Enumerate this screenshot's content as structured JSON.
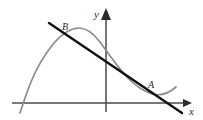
{
  "figure": {
    "background_color": "#ffffff",
    "width": 203,
    "height": 120
  },
  "axes": {
    "x_axis": {
      "label": "x",
      "color": "#4a4a4a",
      "arrow": "right-arrow-icon",
      "start": [
        12,
        103
      ],
      "end": [
        186,
        103
      ],
      "label_position": [
        190,
        112
      ]
    },
    "y_axis": {
      "label": "y",
      "color": "#4a4a4a",
      "arrow": "up-arrow-icon",
      "start": [
        106,
        112
      ],
      "end": [
        106,
        12
      ],
      "label_position": [
        96,
        16
      ]
    },
    "origin": [
      106,
      103
    ]
  },
  "curve": {
    "name": "cubic-curve",
    "color": "#8c8c8c",
    "stroke_width": 1.6,
    "description": "Rises from lower-left, peaks left of the y-axis, descends through the y-axis, reaches a local minimum at the right, then rises slightly",
    "path_points": [
      [
        20,
        112
      ],
      [
        24,
        101
      ],
      [
        30,
        84
      ],
      [
        38,
        66
      ],
      [
        48,
        50
      ],
      [
        58,
        38
      ],
      [
        68,
        31
      ],
      [
        78,
        28
      ],
      [
        86,
        29
      ],
      [
        94,
        34
      ],
      [
        102,
        43
      ],
      [
        110,
        54
      ],
      [
        120,
        67
      ],
      [
        130,
        78
      ],
      [
        140,
        87
      ],
      [
        148,
        92
      ],
      [
        156,
        95
      ],
      [
        163,
        95
      ],
      [
        169,
        93
      ],
      [
        174,
        90
      ],
      [
        178,
        87
      ]
    ]
  },
  "line": {
    "name": "secant-line",
    "color": "#111111",
    "stroke_width": 2.4,
    "description": "Straight line with negative slope crossing the curve at B (upper left) and A (lower right)",
    "start": [
      49,
      23
    ],
    "end": [
      182,
      113
    ]
  },
  "points": [
    {
      "id": "point-b",
      "label": "B",
      "marker_position": [
        66,
        34
      ],
      "label_position": [
        64,
        28
      ],
      "description": "Upper-left intersection of the line and the curve"
    },
    {
      "id": "point-a",
      "label": "A",
      "marker_position": [
        152,
        92
      ],
      "label_position": [
        150,
        86
      ],
      "description": "Lower-right intersection region of the line and the curve"
    }
  ],
  "colors": {
    "curve": "#8c8c8c",
    "line": "#111111",
    "axis": "#4a4a4a",
    "text": "#2b2b2b",
    "background": "#ffffff"
  }
}
